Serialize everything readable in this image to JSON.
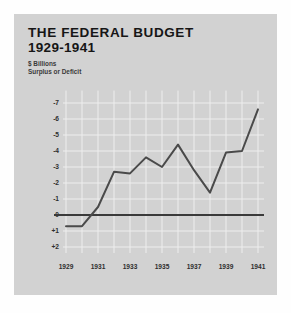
{
  "panel": {
    "background_color": "#d2d2d2",
    "page_background_color": "#fefefe"
  },
  "header": {
    "title": "THE FEDERAL BUDGET",
    "subtitle": "1929-1941",
    "units_line1": "$ Billions",
    "units_line2": "Surplus or Deficit"
  },
  "chart_data": {
    "type": "line",
    "title": "THE FEDERAL BUDGET 1929-1941",
    "subtitle": "$ Billions  Surplus or Deficit",
    "xlabel": "",
    "ylabel": "$ Billions",
    "x": [
      1929,
      1930,
      1931,
      1932,
      1933,
      1934,
      1935,
      1936,
      1937,
      1938,
      1939,
      1940,
      1941
    ],
    "values": [
      0.7,
      0.7,
      -0.5,
      -2.7,
      -2.6,
      -3.6,
      -3.0,
      -4.4,
      -2.8,
      -1.4,
      -3.9,
      -4.0,
      -6.6
    ],
    "series": [
      {
        "name": "Surplus or Deficit",
        "values": [
          0.7,
          0.7,
          -0.5,
          -2.7,
          -2.6,
          -3.6,
          -3.0,
          -4.4,
          -2.8,
          -1.4,
          -3.9,
          -4.0,
          -6.6
        ]
      }
    ],
    "ytick_labels": [
      "-7",
      "-6",
      "-5",
      "-4",
      "-3",
      "-2",
      "-1",
      "0",
      "+1",
      "+2"
    ],
    "ytick_values": [
      -7,
      -6,
      -5,
      -4,
      -3,
      -2,
      -1,
      0,
      1,
      2
    ],
    "xtick_labels": [
      "1929",
      "1931",
      "1933",
      "1935",
      "1937",
      "1939",
      "1941"
    ],
    "xtick_values": [
      1929,
      1931,
      1933,
      1935,
      1937,
      1939,
      1941
    ],
    "ylim": [
      2,
      -7.4
    ],
    "xlim": [
      1929,
      1941
    ],
    "y_axis_inverted": true,
    "grid": true,
    "grid_color": "#eeeeee",
    "legend": "none",
    "line_color": "#4a4a4a",
    "zero_line_color": "#3a3a3a",
    "note": "Deficits are plotted upward; the zero baseline is drawn as a heavy horizontal rule."
  }
}
